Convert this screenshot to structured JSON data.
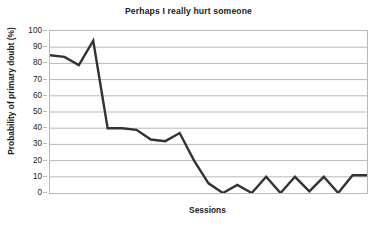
{
  "chart_data": {
    "type": "line",
    "title": "Perhaps I really hurt someone",
    "xlabel": "Sessions",
    "ylabel": "Probability of primary doubt (%)",
    "ylim": [
      0,
      100
    ],
    "ytick_labels": [
      "100",
      "90",
      "80",
      "70",
      "60",
      "50",
      "40",
      "30",
      "20",
      "10",
      "0"
    ],
    "ytick_values": [
      100,
      90,
      80,
      70,
      60,
      50,
      40,
      30,
      20,
      10,
      0
    ],
    "xtick_labels": [],
    "grid": "horizontal",
    "legend": "none",
    "line_color": "#333333",
    "grid_color": "#b9b9b9",
    "series": [
      {
        "name": "Probability of primary doubt",
        "x": [
          1,
          2,
          3,
          4,
          5,
          6,
          7,
          8,
          9,
          10,
          11,
          12,
          13,
          14,
          15,
          16,
          17,
          18,
          19,
          20,
          21,
          22,
          23
        ],
        "values": [
          85,
          84,
          79,
          94,
          40,
          40,
          39,
          33,
          32,
          37,
          20,
          6,
          0,
          5,
          0,
          10,
          0,
          10,
          1,
          10,
          0,
          11,
          11
        ]
      }
    ]
  },
  "figure": {
    "title": "Perhaps I really hurt someone",
    "xlabel": "Sessions",
    "ylabel": "Probability of primary doubt (%)"
  }
}
